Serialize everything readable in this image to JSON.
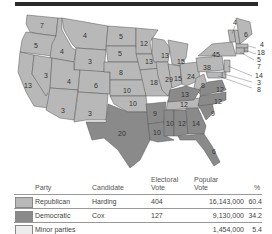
{
  "colors": {
    "republican": "#b8b8b8",
    "democratic": "#8a8a8a",
    "minor": "#ececec",
    "border": "#555555"
  },
  "map": {
    "states": [
      {
        "abbr": "WA",
        "ev": "7"
      },
      {
        "abbr": "OR",
        "ev": "5"
      },
      {
        "abbr": "CA",
        "ev": "13"
      },
      {
        "abbr": "ID",
        "ev": "4"
      },
      {
        "abbr": "NV",
        "ev": "3"
      },
      {
        "abbr": "MT",
        "ev": "4"
      },
      {
        "abbr": "WY",
        "ev": "3"
      },
      {
        "abbr": "UT",
        "ev": "4"
      },
      {
        "abbr": "AZ",
        "ev": "3"
      },
      {
        "abbr": "CO",
        "ev": "6"
      },
      {
        "abbr": "NM",
        "ev": "3"
      },
      {
        "abbr": "ND",
        "ev": "5"
      },
      {
        "abbr": "SD",
        "ev": "5"
      },
      {
        "abbr": "NE",
        "ev": "8"
      },
      {
        "abbr": "KS",
        "ev": "10"
      },
      {
        "abbr": "OK",
        "ev": "10"
      },
      {
        "abbr": "TX",
        "ev": "20"
      },
      {
        "abbr": "MN",
        "ev": "12"
      },
      {
        "abbr": "IA",
        "ev": "13"
      },
      {
        "abbr": "MO",
        "ev": "18"
      },
      {
        "abbr": "AR",
        "ev": "9"
      },
      {
        "abbr": "LA",
        "ev": "10"
      },
      {
        "abbr": "WI",
        "ev": "13"
      },
      {
        "abbr": "IL",
        "ev": "29"
      },
      {
        "abbr": "MI",
        "ev": "15"
      },
      {
        "abbr": "IN",
        "ev": "15"
      },
      {
        "abbr": "OH",
        "ev": "24"
      },
      {
        "abbr": "KY",
        "ev": "13"
      },
      {
        "abbr": "TN",
        "ev": "12"
      },
      {
        "abbr": "MS",
        "ev": "10"
      },
      {
        "abbr": "AL",
        "ev": "12"
      },
      {
        "abbr": "GA",
        "ev": "14"
      },
      {
        "abbr": "FL",
        "ev": "6"
      },
      {
        "abbr": "SC",
        "ev": "9"
      },
      {
        "abbr": "NC",
        "ev": "12"
      },
      {
        "abbr": "VA",
        "ev": "12"
      },
      {
        "abbr": "WV",
        "ev": "8"
      },
      {
        "abbr": "PA",
        "ev": "38"
      },
      {
        "abbr": "NY",
        "ev": "45"
      },
      {
        "abbr": "VT",
        "ev": "4"
      },
      {
        "abbr": "ME",
        "ev": "6"
      },
      {
        "abbr": "NH",
        "ev": "4"
      },
      {
        "abbr": "MA",
        "ev": "18"
      },
      {
        "abbr": "RI",
        "ev": "5"
      },
      {
        "abbr": "CT",
        "ev": "7"
      },
      {
        "abbr": "NJ",
        "ev": "14"
      },
      {
        "abbr": "DE",
        "ev": "3"
      },
      {
        "abbr": "MD",
        "ev": "8"
      }
    ]
  },
  "table": {
    "headers": {
      "party": "Party",
      "candidate": "Candidate",
      "electoral": "Electoral\nVote",
      "electoral_l1": "Electoral",
      "electoral_l2": "Vote",
      "popular_l1": "Popular",
      "popular_l2": "Vote",
      "percent": "%"
    },
    "rows": [
      {
        "party": "Republican",
        "candidate": "Harding",
        "electoral": "404",
        "popular": "16,143,000",
        "percent": "60.4"
      },
      {
        "party": "Democratic",
        "candidate": "Cox",
        "electoral": "127",
        "popular": "9,130,000",
        "percent": "34.2"
      },
      {
        "party": "Minor parties",
        "candidate": "",
        "electoral": "",
        "popular": "1,454,000",
        "percent": "5.4"
      }
    ]
  }
}
